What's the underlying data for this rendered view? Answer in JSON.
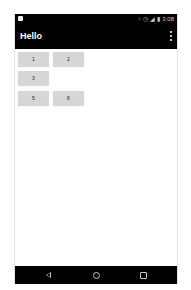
{
  "status_bar": {
    "time": "3:08",
    "icons": [
      "notification-icon",
      "vibrate-icon",
      "alarm-icon",
      "signal-icon",
      "battery-icon"
    ]
  },
  "app_bar": {
    "title": "Hello",
    "overflow_icon": "more-vert-icon"
  },
  "buttons": [
    {
      "label": "1"
    },
    {
      "label": "2"
    },
    {
      "label": "3"
    },
    {
      "label": "5"
    },
    {
      "label": "6"
    }
  ],
  "nav_bar": {
    "back_icon": "back-triangle-icon",
    "home_icon": "home-circle-icon",
    "recents_icon": "recents-square-icon"
  }
}
